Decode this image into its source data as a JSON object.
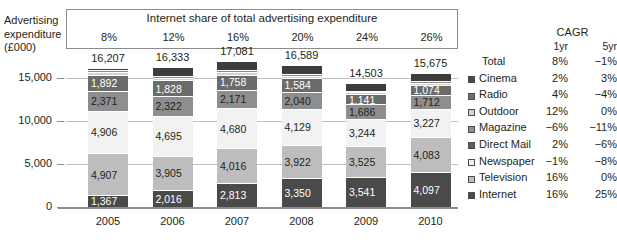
{
  "axis_title": "Advertising expenditure (£000)",
  "axis_title_lines": [
    "Advertising",
    "expenditure",
    "(£000)"
  ],
  "banner": {
    "title": "Internet share of total advertising expenditure",
    "values": [
      "8%",
      "12%",
      "16%",
      "20%",
      "24%",
      "26%"
    ]
  },
  "cagr": {
    "header": "CAGR",
    "col_1yr": "1yr",
    "col_5yr": "5yr"
  },
  "legend": [
    {
      "name": "Total",
      "swatch": null,
      "cagr_1yr": "8%",
      "cagr_5yr": "−1%"
    },
    {
      "name": "Cinema",
      "swatch": "#454545",
      "cagr_1yr": "2%",
      "cagr_5yr": "3%"
    },
    {
      "name": "Radio",
      "swatch": "#6e6e6e",
      "cagr_1yr": "4%",
      "cagr_5yr": "−4%"
    },
    {
      "name": "Outdoor",
      "swatch": "#d2d2d2",
      "cagr_1yr": "12%",
      "cagr_5yr": "0%"
    },
    {
      "name": "Magazine",
      "swatch": "#8e8e8e",
      "cagr_1yr": "−6%",
      "cagr_5yr": "−11%"
    },
    {
      "name": "Direct Mail",
      "swatch": "#5f5f5f",
      "cagr_1yr": "2%",
      "cagr_5yr": "−6%"
    },
    {
      "name": "Newspaper",
      "swatch": "#f0f0f0",
      "cagr_1yr": "−1%",
      "cagr_5yr": "−8%"
    },
    {
      "name": "Television",
      "swatch": "#bdbdbd",
      "cagr_1yr": "16%",
      "cagr_5yr": "0%"
    },
    {
      "name": "Internet",
      "swatch": "#4a4a4a",
      "cagr_1yr": "16%",
      "cagr_5yr": "25%"
    }
  ],
  "chart_data": {
    "type": "bar",
    "title": "Internet share of total advertising expenditure",
    "xlabel": "",
    "ylabel": "Advertising expenditure (£000)",
    "ylim": [
      0,
      17500
    ],
    "yticks": [
      0,
      5000,
      10000,
      15000
    ],
    "ytick_labels": [
      "0",
      "5,000",
      "10,000",
      "15,000"
    ],
    "grid": true,
    "stacked": true,
    "legend_position": "right",
    "categories": [
      "2005",
      "2006",
      "2007",
      "2008",
      "2009",
      "2010"
    ],
    "totals": [
      16207,
      16333,
      17081,
      16589,
      14503,
      15675
    ],
    "total_labels": [
      "16,207",
      "16,333",
      "17,081",
      "16,589",
      "14,503",
      "15,675"
    ],
    "internet_share": [
      "8%",
      "12%",
      "16%",
      "20%",
      "24%",
      "26%"
    ],
    "stack_order_bottom_to_top": [
      "Internet",
      "Television",
      "Newspaper",
      "Magazine",
      "Direct Mail",
      "Outdoor",
      "Radio",
      "Cinema"
    ],
    "series": [
      {
        "name": "Internet",
        "color": "#4a4a4a",
        "label_color": "#ffffff",
        "values": [
          1367,
          2016,
          2813,
          3350,
          3541,
          4097
        ],
        "labels": [
          "1,367",
          "2,016",
          "2,813",
          "3,350",
          "3,541",
          "4,097"
        ]
      },
      {
        "name": "Television",
        "color": "#bdbdbd",
        "label_color": "#231f20",
        "values": [
          4907,
          3905,
          4016,
          3922,
          3525,
          4083
        ],
        "labels": [
          "4,907",
          "3,905",
          "4,016",
          "3,922",
          "3,525",
          "4,083"
        ]
      },
      {
        "name": "Newspaper",
        "color": "#f2f2f2",
        "label_color": "#231f20",
        "values": [
          4906,
          4695,
          4680,
          4129,
          3244,
          3227
        ],
        "labels": [
          "4,906",
          "4,695",
          "4,680",
          "4,129",
          "3,244",
          "3,227"
        ]
      },
      {
        "name": "Magazine",
        "color": "#8e8e8e",
        "label_color": "#231f20",
        "values": [
          2371,
          2322,
          2171,
          2040,
          1686,
          1712
        ],
        "labels": [
          "2,371",
          "2,322",
          "2,171",
          "2,040",
          "1,686",
          "1,712"
        ]
      },
      {
        "name": "Direct Mail",
        "color": "#6b6b6b",
        "label_color": "#ffffff",
        "values": [
          1892,
          1828,
          1758,
          1584,
          1141,
          1074
        ],
        "labels": [
          "1,892",
          "1,828",
          "1,758",
          "1,584",
          "1,141",
          "1,074"
        ]
      },
      {
        "name": "Outdoor",
        "color": "#d2d2d2",
        "label_color": "#231f20",
        "values": [
          330,
          320,
          310,
          300,
          260,
          270
        ],
        "labels": [
          "",
          "",
          "",
          "",
          "",
          ""
        ]
      },
      {
        "name": "Radio",
        "color": "#8a8a8a",
        "label_color": "#231f20",
        "values": [
          260,
          250,
          240,
          230,
          200,
          200
        ],
        "labels": [
          "",
          "",
          "",
          "",
          "",
          ""
        ]
      },
      {
        "name": "Cinema",
        "color": "#3d3d3d",
        "label_color": "#ffffff",
        "values": [
          174,
          997,
          1093,
          1034,
          906,
          1012
        ],
        "labels": [
          "",
          "",
          "",
          "",
          "",
          ""
        ]
      }
    ]
  }
}
